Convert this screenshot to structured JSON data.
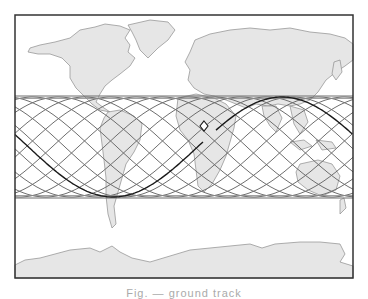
{
  "figure": {
    "type": "ground-track-map",
    "projection": "equirectangular world map",
    "frame": {
      "x": 15,
      "y": 15,
      "width": 338,
      "height": 263
    },
    "colors": {
      "land": "#e6e6e6",
      "coast": "#8c8c8c",
      "ocean": "#ffffff",
      "frame": "#333333",
      "swath_tracks": "#6e6e6e",
      "current_track": "#1a1a1a"
    },
    "swath": {
      "label": "ground-track swath band",
      "top_y": 96,
      "bottom_y": 198,
      "center_y": 147,
      "amplitude_px": 50,
      "period_px": 338,
      "track_spacing_px": 26
    },
    "current_track": {
      "label": "current orbit ground track",
      "start": [
        15,
        130
      ],
      "trough": [
        113,
        197
      ],
      "end_marker": [
        204,
        126
      ],
      "second_segment_peak": [
        282,
        97
      ],
      "end_at_right": [
        353,
        133
      ]
    },
    "marker": {
      "shape": "diamond",
      "x": 204,
      "y": 126,
      "label": "satellite position"
    },
    "caption": "Fig. — ground track"
  }
}
